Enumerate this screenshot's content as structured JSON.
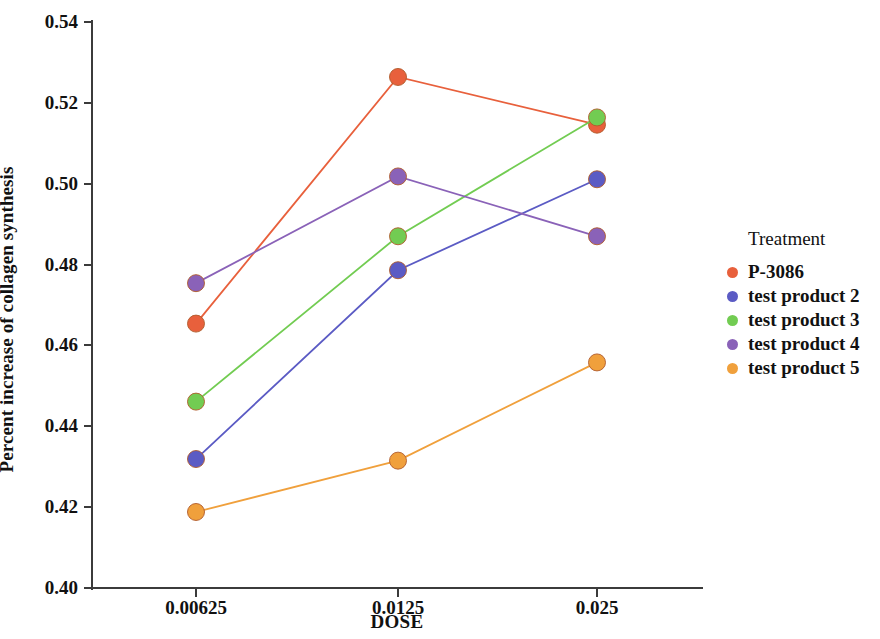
{
  "chart_data": {
    "type": "line",
    "title": "",
    "xlabel": "DOSE",
    "ylabel": "Percent increase of collagen synthesis",
    "categories": [
      "0.00625",
      "0.0125",
      "0.025"
    ],
    "x": [
      0.00625,
      0.0125,
      0.025
    ],
    "ylim": [
      0.4,
      0.54
    ],
    "yticks": [
      "0.40",
      "0.42",
      "0.44",
      "0.46",
      "0.48",
      "0.50",
      "0.52",
      "0.54"
    ],
    "ytick_values": [
      0.4,
      0.42,
      0.44,
      0.46,
      0.48,
      0.5,
      0.52,
      0.54
    ],
    "grid": false,
    "legend_position": "right",
    "legend_title": "Treatment",
    "markers": "filled-circle",
    "series": [
      {
        "name": "P-3086",
        "color": "#e8603c",
        "values": [
          0.4654,
          0.5264,
          0.5146
        ]
      },
      {
        "name": "test product 2",
        "color": "#5b5bc4",
        "values": [
          0.4319,
          0.4786,
          0.5011
        ]
      },
      {
        "name": "test product 3",
        "color": "#72cc52",
        "values": [
          0.4461,
          0.487,
          0.5164
        ]
      },
      {
        "name": "test product 4",
        "color": "#8a62b8",
        "values": [
          0.4754,
          0.5018,
          0.487
        ]
      },
      {
        "name": "test product 5",
        "color": "#f0a03c",
        "values": [
          0.4188,
          0.4315,
          0.4558
        ]
      }
    ]
  }
}
